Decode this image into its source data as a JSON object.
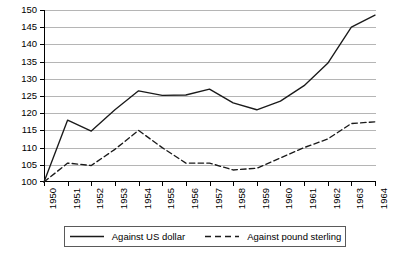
{
  "chart_data": {
    "type": "line",
    "title": "",
    "subtitle": "",
    "xlabel": "",
    "ylabel": "",
    "x": [
      1950,
      1951,
      1952,
      1953,
      1954,
      1955,
      1956,
      1957,
      1958,
      1959,
      1960,
      1961,
      1962,
      1963,
      1964
    ],
    "categories": [
      "1950",
      "1951",
      "1952",
      "1953",
      "1954",
      "1955",
      "1956",
      "1957",
      "1958",
      "1959",
      "1960",
      "1961",
      "1962",
      "1963",
      "1964"
    ],
    "xlim": [
      1950,
      1964
    ],
    "ylim": [
      100,
      150
    ],
    "yticks": [
      100,
      105,
      110,
      115,
      120,
      125,
      130,
      135,
      140,
      145,
      150
    ],
    "ytick_labels": [
      "100",
      "105",
      "110",
      "115",
      "120",
      "125",
      "130",
      "135",
      "140",
      "145",
      "150"
    ],
    "grid": "horizontal",
    "legend_position": "bottom",
    "series": [
      {
        "name": "Against US dollar",
        "style": "solid",
        "color": "#1a1a1a",
        "values": [
          100,
          118,
          114.8,
          121,
          126.5,
          125.2,
          125.3,
          127,
          123,
          121,
          123.5,
          128,
          134.5,
          145,
          148.5
        ]
      },
      {
        "name": "Against pound sterling",
        "style": "dashed",
        "color": "#1a1a1a",
        "values": [
          100,
          105.5,
          104.8,
          109.5,
          115,
          110,
          105.5,
          105.5,
          103.5,
          104,
          107,
          110,
          112.5,
          117,
          117.5
        ]
      }
    ]
  },
  "legend": {
    "entries": [
      {
        "label": "Against US dollar",
        "style": "solid"
      },
      {
        "label": "Against pound sterling",
        "style": "dashed"
      }
    ]
  }
}
